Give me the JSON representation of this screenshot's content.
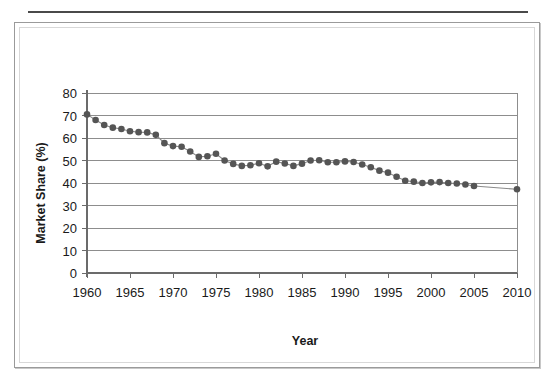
{
  "page": {
    "background_color": "#ffffff",
    "top_rule_color": "#4a4a4a",
    "figure_border_color": "#9a9a9a"
  },
  "figure": {
    "name": "market-share-line-chart"
  },
  "chart_data": {
    "type": "line",
    "title": "",
    "subtitle": "",
    "xlabel": "Year",
    "ylabel": "Market Share (%)",
    "xlim": [
      1960,
      2010
    ],
    "ylim": [
      0,
      80
    ],
    "ytick_labels": [
      "0",
      "10",
      "20",
      "30",
      "40",
      "50",
      "60",
      "70",
      "80"
    ],
    "yticks": [
      0,
      10,
      20,
      30,
      40,
      50,
      60,
      70,
      80
    ],
    "xtick_labels": [
      "1960",
      "1965",
      "1970",
      "1975",
      "1980",
      "1985",
      "1990",
      "1995",
      "2000",
      "2005",
      "2010"
    ],
    "xticks": [
      1960,
      1965,
      1970,
      1975,
      1980,
      1985,
      1990,
      1995,
      2000,
      2005,
      2010
    ],
    "grid": "horizontal",
    "legend": "none",
    "marker_color": "#555555",
    "line_color": "#8a8a8a",
    "marker_shape": "circle",
    "series": [
      {
        "name": "Market Share",
        "x": [
          1960,
          1961,
          1962,
          1963,
          1964,
          1965,
          1966,
          1967,
          1968,
          1969,
          1970,
          1971,
          1972,
          1973,
          1974,
          1975,
          1976,
          1977,
          1978,
          1979,
          1980,
          1981,
          1982,
          1983,
          1984,
          1985,
          1986,
          1987,
          1988,
          1989,
          1990,
          1991,
          1992,
          1993,
          1994,
          1995,
          1996,
          1997,
          1998,
          1999,
          2000,
          2001,
          2002,
          2003,
          2004,
          2005,
          2010
        ],
        "values": [
          70.5,
          68.0,
          65.8,
          64.6,
          64.0,
          63.0,
          62.6,
          62.5,
          61.4,
          57.7,
          56.4,
          56.1,
          54.0,
          51.6,
          51.9,
          53.0,
          50.0,
          48.5,
          47.6,
          47.9,
          48.8,
          47.4,
          49.5,
          48.7,
          47.6,
          48.6,
          50.0,
          50.1,
          49.2,
          49.2,
          49.6,
          49.3,
          48.2,
          47.0,
          45.5,
          44.6,
          42.8,
          41.0,
          40.6,
          40.0,
          40.3,
          40.4,
          40.0,
          39.8,
          39.3,
          38.7,
          37.2
        ]
      }
    ],
    "annotations": [
      {
        "text": "gap between final plotted marker at 2005 and endpoint at 2010"
      }
    ]
  },
  "axis_titles": {
    "x": "Year",
    "y": "Market Share (%)"
  }
}
